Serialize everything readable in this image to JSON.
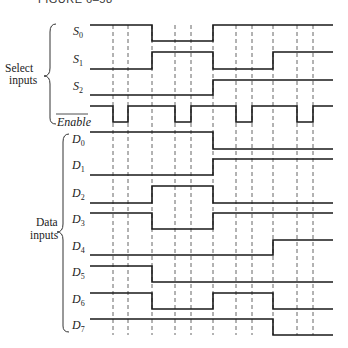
{
  "figure": {
    "title": "FIGURE 6–58"
  },
  "groups": {
    "select": {
      "label_line1": "Select",
      "label_line2": "inputs"
    },
    "data": {
      "label_line1": "Data",
      "label_line2": "inputs"
    }
  },
  "timing": {
    "x_start": 90,
    "x_end": 333,
    "dashed_lines_x": [
      113,
      128,
      152,
      175,
      191,
      213,
      236,
      252,
      273,
      297,
      313
    ],
    "line_color": "#1a1a1a"
  },
  "signals": [
    {
      "name": "S",
      "sub": "0",
      "overbar": false,
      "high_y": 25,
      "low_y": 41,
      "levels": [
        [
          90,
          1
        ],
        [
          152,
          0
        ],
        [
          213,
          1
        ]
      ]
    },
    {
      "name": "S",
      "sub": "1",
      "overbar": false,
      "high_y": 52,
      "low_y": 69,
      "levels": [
        [
          90,
          0
        ],
        [
          152,
          1
        ],
        [
          213,
          0
        ],
        [
          273,
          1
        ]
      ]
    },
    {
      "name": "S",
      "sub": "2",
      "overbar": false,
      "high_y": 80,
      "low_y": 95,
      "levels": [
        [
          90,
          0
        ],
        [
          213,
          1
        ]
      ]
    },
    {
      "name": "Enable",
      "sub": "",
      "overbar": true,
      "high_y": 106,
      "low_y": 122,
      "levels": [
        [
          90,
          1
        ],
        [
          113,
          0
        ],
        [
          128,
          1
        ],
        [
          175,
          0
        ],
        [
          191,
          1
        ],
        [
          236,
          0
        ],
        [
          252,
          1
        ],
        [
          297,
          0
        ],
        [
          313,
          1
        ]
      ]
    },
    {
      "name": "D",
      "sub": "0",
      "overbar": false,
      "high_y": 132,
      "low_y": 149,
      "levels": [
        [
          90,
          1
        ],
        [
          213,
          0
        ]
      ]
    },
    {
      "name": "D",
      "sub": "1",
      "overbar": false,
      "high_y": 159,
      "low_y": 175,
      "levels": [
        [
          90,
          0
        ],
        [
          213,
          1
        ]
      ]
    },
    {
      "name": "D",
      "sub": "2",
      "overbar": false,
      "high_y": 186,
      "low_y": 203,
      "levels": [
        [
          90,
          0
        ],
        [
          152,
          1
        ],
        [
          213,
          0
        ]
      ]
    },
    {
      "name": "D",
      "sub": "3",
      "overbar": false,
      "high_y": 213,
      "low_y": 229,
      "levels": [
        [
          90,
          1
        ],
        [
          152,
          0
        ],
        [
          213,
          1
        ]
      ]
    },
    {
      "name": "D",
      "sub": "4",
      "overbar": false,
      "high_y": 240,
      "low_y": 255,
      "levels": [
        [
          90,
          0
        ],
        [
          273,
          1
        ]
      ]
    },
    {
      "name": "D",
      "sub": "5",
      "overbar": false,
      "high_y": 266,
      "low_y": 282,
      "levels": [
        [
          90,
          1
        ],
        [
          152,
          0
        ]
      ]
    },
    {
      "name": "D",
      "sub": "6",
      "overbar": false,
      "high_y": 293,
      "low_y": 309,
      "levels": [
        [
          90,
          1
        ],
        [
          152,
          0
        ],
        [
          213,
          1
        ],
        [
          273,
          0
        ]
      ]
    },
    {
      "name": "D",
      "sub": "7",
      "overbar": false,
      "high_y": 319,
      "low_y": 335,
      "levels": [
        [
          90,
          1
        ],
        [
          273,
          0
        ]
      ]
    }
  ]
}
